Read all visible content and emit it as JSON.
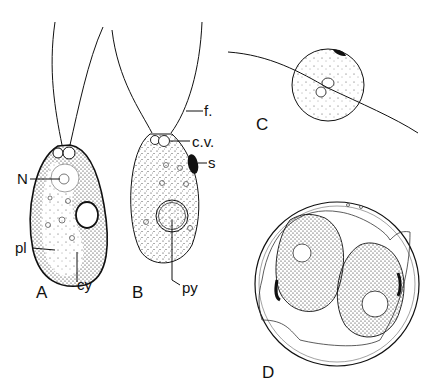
{
  "figure": {
    "panels": [
      {
        "id": "A",
        "label": "A"
      },
      {
        "id": "B",
        "label": "B"
      },
      {
        "id": "C",
        "label": "C"
      },
      {
        "id": "D",
        "label": "D"
      }
    ],
    "annotations": {
      "nucleus": "N",
      "plastid": "pl",
      "cytoplasm": "cy",
      "flagellum": "f.",
      "contractile_vacuole": "c.v.",
      "stigma": "s",
      "pyrenoid": "py"
    },
    "colors": {
      "ink": "#111111",
      "background": "#ffffff"
    }
  }
}
